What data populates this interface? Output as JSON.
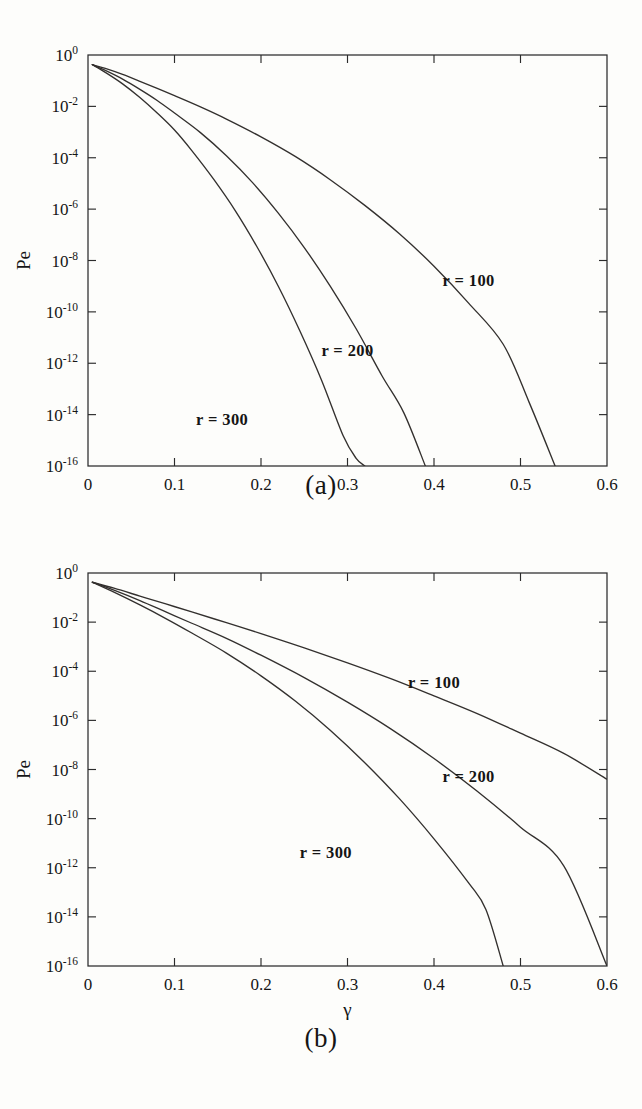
{
  "figure": {
    "background_color": "#fdfdfb",
    "ink_color": "#33302e",
    "panels": [
      {
        "id": "a",
        "caption": "(a)"
      },
      {
        "id": "b",
        "caption": "(b)"
      }
    ]
  },
  "axes": {
    "xlabel": "γ",
    "ylabel": "Pe",
    "x_ticks": [
      "0",
      "0.1",
      "0.2",
      "0.3",
      "0.4",
      "0.5",
      "0.6"
    ],
    "x_tick_values": [
      0,
      0.1,
      0.2,
      0.3,
      0.4,
      0.5,
      0.6
    ],
    "y_ticks": [
      "0",
      "-2",
      "-4",
      "-6",
      "-8",
      "-10",
      "-12",
      "-14",
      "-16"
    ],
    "y_tick_mantissa": "10",
    "y_tick_exponents": [
      0,
      -2,
      -4,
      -6,
      -8,
      -10,
      -12,
      -14,
      -16
    ],
    "xlim": [
      0,
      0.6
    ],
    "ylim_log10": [
      -16,
      0
    ],
    "grid": false,
    "yscale": "log",
    "xscale": "linear"
  },
  "labels": {
    "r100": "r = 100",
    "r200": "r = 200",
    "r300": "r = 300"
  },
  "chart_data": [
    {
      "type": "line",
      "panel": "a",
      "title": "",
      "xlabel": "γ",
      "ylabel": "Pe",
      "xlim": [
        0,
        0.6
      ],
      "ylim": [
        1e-16,
        1
      ],
      "yscale": "log",
      "grid": false,
      "legend_position": "inline-annotations",
      "annotations": [
        {
          "text": "r = 100",
          "x": 0.44,
          "y": 1e-09
        },
        {
          "text": "r = 200",
          "x": 0.3,
          "y": 2e-12
        },
        {
          "text": "r = 300",
          "x": 0.155,
          "y": 4e-15
        }
      ],
      "series": [
        {
          "name": "r = 100",
          "x": [
            0.005,
            0.02,
            0.04,
            0.06,
            0.08,
            0.1,
            0.13,
            0.16,
            0.2,
            0.24,
            0.28,
            0.32,
            0.36,
            0.4,
            0.44,
            0.48,
            0.51,
            0.54
          ],
          "y": [
            0.42,
            0.3,
            0.175,
            0.095,
            0.05,
            0.026,
            0.0095,
            0.0032,
            0.00065,
            0.00011,
            1.4e-05,
            1.4e-06,
            1.1e-07,
            6e-09,
            2.2e-10,
            5.5e-12,
            3e-14,
            1e-16
          ]
        },
        {
          "name": "r = 200",
          "x": [
            0.005,
            0.02,
            0.04,
            0.06,
            0.08,
            0.1,
            0.13,
            0.16,
            0.19,
            0.22,
            0.25,
            0.28,
            0.31,
            0.34,
            0.365,
            0.39
          ],
          "y": [
            0.42,
            0.25,
            0.115,
            0.046,
            0.017,
            0.0055,
            0.00095,
            0.00012,
            1.1e-05,
            7e-07,
            3.2e-08,
            1e-09,
            2.2e-11,
            3.2e-13,
            1.2e-14,
            1e-16
          ]
        },
        {
          "name": "r = 300",
          "x": [
            0.005,
            0.02,
            0.04,
            0.06,
            0.08,
            0.1,
            0.12,
            0.145,
            0.17,
            0.195,
            0.22,
            0.245,
            0.27,
            0.295,
            0.31,
            0.32
          ],
          "y": [
            0.42,
            0.21,
            0.075,
            0.022,
            0.0055,
            0.0012,
            0.00019,
            1.5e-05,
            9e-07,
            3.6e-08,
            1e-09,
            1.8e-11,
            2.2e-13,
            1.5e-15,
            2e-16,
            1e-16
          ]
        }
      ]
    },
    {
      "type": "line",
      "panel": "b",
      "title": "",
      "xlabel": "γ",
      "ylabel": "Pe",
      "xlim": [
        0,
        0.6
      ],
      "ylim": [
        1e-16,
        1
      ],
      "yscale": "log",
      "grid": false,
      "legend_position": "inline-annotations",
      "annotations": [
        {
          "text": "r = 100",
          "x": 0.4,
          "y": 2e-05
        },
        {
          "text": "r = 200",
          "x": 0.44,
          "y": 3e-09
        },
        {
          "text": "r = 300",
          "x": 0.275,
          "y": 2.5e-12
        }
      ],
      "series": [
        {
          "name": "r = 100",
          "x": [
            0.005,
            0.03,
            0.06,
            0.09,
            0.12,
            0.16,
            0.2,
            0.25,
            0.3,
            0.35,
            0.4,
            0.45,
            0.5,
            0.55,
            0.6
          ],
          "y": [
            0.42,
            0.24,
            0.115,
            0.055,
            0.026,
            0.0095,
            0.0034,
            0.0009,
            0.00022,
            5e-05,
            1e-05,
            1.9e-06,
            3e-07,
            4.5e-08,
            4e-09
          ]
        },
        {
          "name": "r = 200",
          "x": [
            0.005,
            0.03,
            0.06,
            0.09,
            0.12,
            0.16,
            0.2,
            0.25,
            0.3,
            0.35,
            0.4,
            0.45,
            0.5,
            0.55,
            0.6
          ],
          "y": [
            0.42,
            0.2,
            0.075,
            0.026,
            0.009,
            0.0022,
            0.00045,
            5.5e-05,
            5.5e-06,
            4.5e-07,
            2.8e-08,
            1.3e-09,
            4.5e-11,
            1.2e-12,
            1e-16
          ]
        },
        {
          "name": "r = 300",
          "x": [
            0.005,
            0.03,
            0.06,
            0.09,
            0.12,
            0.16,
            0.2,
            0.24,
            0.28,
            0.32,
            0.36,
            0.4,
            0.44,
            0.46,
            0.48
          ],
          "y": [
            0.42,
            0.165,
            0.05,
            0.014,
            0.0036,
            0.00055,
            6.5e-05,
            6e-06,
            4e-07,
            1.9e-08,
            6.5e-10,
            1.5e-11,
            2.4e-13,
            2e-14,
            1e-16
          ]
        }
      ]
    }
  ]
}
